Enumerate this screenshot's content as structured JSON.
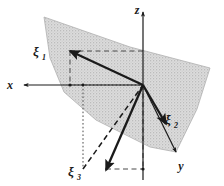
{
  "figure": {
    "background_color": "#ffffff",
    "line_color": "#1a1a1a",
    "plane_fill_color": "#d4d4d4",
    "plane_stipple_color": "#9a9a9a",
    "dashed_color": "#555555"
  },
  "axes": [
    {
      "key": "x",
      "label": "x",
      "label_x": 10,
      "label_y": 85,
      "arrow_direction": "left",
      "description": "horizontal axis pointing left"
    },
    {
      "key": "z",
      "label": "z",
      "label_x": 137,
      "label_y": 13,
      "arrow_direction": "up",
      "description": "vertical axis pointing up"
    },
    {
      "key": "y",
      "label": "y",
      "label_x": 180,
      "label_y": 166,
      "arrow_direction": "down-right",
      "description": "oblique axis pointing down to the right"
    }
  ],
  "vectors": [
    {
      "key": "xi1",
      "symbol": "ξ",
      "subscript": "1",
      "label_x": 36,
      "label_y": 54,
      "tip_x": 70,
      "tip_y": 51,
      "tail_x": 143,
      "tail_y": 85,
      "description": "vector pointing up-left from origin"
    },
    {
      "key": "xi2",
      "symbol": "ξ",
      "subscript": "2",
      "label_x": 168,
      "label_y": 120,
      "tip_x": 162,
      "tip_y": 117,
      "tail_x": 143,
      "tail_y": 85,
      "description": "vector pointing down-right from origin"
    },
    {
      "key": "xi3",
      "symbol": "ξ",
      "subscript": "3",
      "label_x": 70,
      "label_y": 173,
      "tip_x": 106,
      "tip_y": 169,
      "tail_x": 143,
      "tail_y": 85,
      "description": "vector pointing down-left from origin"
    }
  ],
  "origin": {
    "x": 143,
    "y": 85
  },
  "construction_lines": [
    {
      "key": "xi1-horizontal-projection",
      "style": "dashed",
      "description": "dashed horizontal line from xi-1 tip to the z-axis"
    },
    {
      "key": "xi1-vertical-projection",
      "style": "dashed",
      "description": "dashed vertical line from xi-1 tip down to the x-axis"
    },
    {
      "key": "xi3-box-left",
      "style": "dotted",
      "description": "dotted vertical line of the projection box"
    },
    {
      "key": "xi3-box-top",
      "style": "dotted",
      "description": "dotted horizontal line of the projection box"
    },
    {
      "key": "xi3-horizontal-projection",
      "style": "dashed",
      "description": "dashed horizontal line from xi-3 tip to the z-axis"
    },
    {
      "key": "xi2-vertical-drop",
      "style": "dashed",
      "description": "dashed vertical line below the origin along z-axis"
    }
  ]
}
